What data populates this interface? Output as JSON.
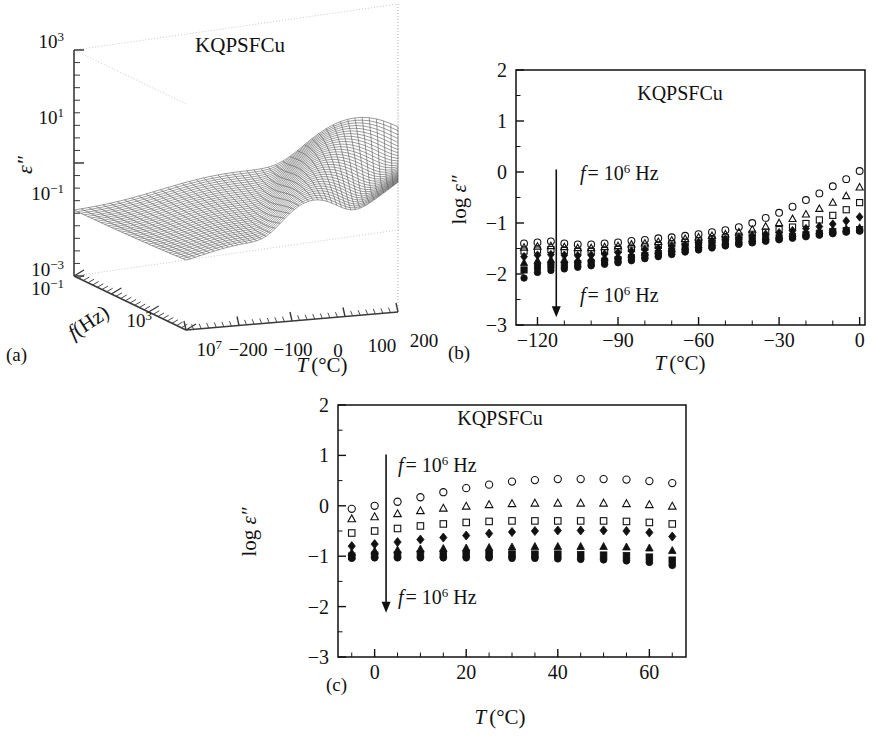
{
  "figure": {
    "background": "#ffffff",
    "ink": "#111111",
    "panels": [
      "a",
      "b",
      "c"
    ]
  },
  "panel_a": {
    "caption": "(a)",
    "sample_label": "KQPSFCu",
    "zlabel": "ε″",
    "flabel_italic": "f",
    "flabel_rest": "(Hz)",
    "tlabel_italic": "T",
    "tlabel_rest": "(°C)",
    "z_ticks": [
      "10",
      "10",
      "10"
    ],
    "z_tick_exponents": [
      "3",
      "1",
      "−1"
    ],
    "z_tick_low": "10",
    "z_tick_low_exp": "−3",
    "f_ticks": [
      "10",
      "10",
      "10"
    ],
    "f_tick_exponents": [
      "−1",
      "3",
      "7"
    ],
    "t_ticks": [
      "−200",
      "−100",
      "0",
      "100",
      "200"
    ]
  },
  "panel_b": {
    "caption": "(b)",
    "sample_label": "KQPSFCu",
    "ylabel_prefix": "log ",
    "ylabel_eps": "ε″",
    "xlabel_italic": "T",
    "xlabel_rest": "(°C)",
    "annotation_top": {
      "f": "f",
      "eq": "= 10",
      "exp": "6",
      "unit": " Hz"
    },
    "annotation_bottom": {
      "f": "f",
      "eq": "= 10",
      "exp": "6",
      "unit": " Hz"
    },
    "arrow_name": "decreasing-frequency-arrow",
    "y_ticks": [
      "2",
      "1",
      "0",
      "−1",
      "−2",
      "−3"
    ],
    "x_ticks": [
      "−120",
      "−90",
      "−60",
      "−30",
      "0"
    ]
  },
  "panel_c": {
    "caption": "(c)",
    "sample_label": "KQPSFCu",
    "ylabel_prefix": "log ",
    "ylabel_eps": "ε″",
    "xlabel_italic": "T",
    "xlabel_rest": "(°C)",
    "annotation_top": {
      "f": "f",
      "eq": "= 10",
      "exp": "6",
      "unit": " Hz"
    },
    "annotation_bottom": {
      "f": "f",
      "eq": "= 10",
      "exp": "6",
      "unit": " Hz"
    },
    "arrow_name": "decreasing-frequency-arrow",
    "y_ticks": [
      "2",
      "1",
      "0",
      "−1",
      "−2",
      "−3"
    ],
    "x_ticks": [
      "0",
      "20",
      "40",
      "60"
    ]
  },
  "chart_data": [
    {
      "id": "panel-a",
      "type": "surface",
      "title": "KQPSFCu",
      "xlabel": "T (°C)",
      "ylabel": "f (Hz)",
      "zlabel": "ε″",
      "xlim": [
        -200,
        200
      ],
      "ylim_log10": [
        -1,
        7
      ],
      "zlim_log10": [
        -3,
        3
      ],
      "x_tick_values": [
        -200,
        -100,
        0,
        100,
        200
      ],
      "y_tick_values_log10": [
        -1,
        3,
        7
      ],
      "z_tick_values_log10": [
        -3,
        -1,
        1,
        3
      ],
      "grid": false,
      "description": "Dense wireframe mesh of dielectric loss over temperature and frequency; a broad low plateau at low temperature/low frequency rising to a sharp alpha-relaxation ridge peaking near eps''~30 at high temperature, plus a secondary shoulder on the low-temperature side.",
      "mesh": {
        "nx": 41,
        "ny": 33,
        "peak_z_log10": 1.5,
        "plateau_z_log10": -1.7
      }
    },
    {
      "id": "panel-b",
      "type": "scatter",
      "title": "KQPSFCu",
      "xlabel": "T (°C)",
      "ylabel": "log ε″",
      "xlim": [
        -128,
        2
      ],
      "ylim": [
        -3,
        2
      ],
      "x_tick_values": [
        -120,
        -90,
        -60,
        -30,
        0
      ],
      "y_tick_values": [
        -3,
        -2,
        -1,
        0,
        1,
        2
      ],
      "grid": false,
      "annotations": [
        {
          "text": "f = 10^6 Hz",
          "x": -95,
          "y": -0.15
        },
        {
          "text": "f = 10^6 Hz",
          "x": -95,
          "y": -2.35
        },
        {
          "text": "arrow",
          "x": -113,
          "y0": 0.05,
          "y1": -2.85
        }
      ],
      "x": [
        -125,
        -120,
        -115,
        -110,
        -105,
        -100,
        -95,
        -90,
        -85,
        -80,
        -75,
        -70,
        -65,
        -60,
        -55,
        -50,
        -45,
        -40,
        -35,
        -30,
        -25,
        -20,
        -15,
        -10,
        -5,
        0
      ],
      "series": [
        {
          "name": "10^6 Hz",
          "marker": "open-circle",
          "values": [
            -1.4,
            -1.38,
            -1.36,
            -1.4,
            -1.42,
            -1.42,
            -1.4,
            -1.38,
            -1.35,
            -1.33,
            -1.3,
            -1.28,
            -1.25,
            -1.22,
            -1.18,
            -1.14,
            -1.08,
            -1.0,
            -0.9,
            -0.8,
            -0.68,
            -0.55,
            -0.42,
            -0.28,
            -0.14,
            0.02
          ]
        },
        {
          "name": "10^5 Hz",
          "marker": "open-triangle",
          "values": [
            -1.48,
            -1.46,
            -1.45,
            -1.47,
            -1.49,
            -1.49,
            -1.47,
            -1.45,
            -1.42,
            -1.4,
            -1.37,
            -1.34,
            -1.31,
            -1.28,
            -1.25,
            -1.22,
            -1.18,
            -1.13,
            -1.07,
            -1.0,
            -0.92,
            -0.83,
            -0.72,
            -0.6,
            -0.47,
            -0.3
          ]
        },
        {
          "name": "10^4 Hz",
          "marker": "open-square",
          "values": [
            -1.55,
            -1.53,
            -1.52,
            -1.54,
            -1.56,
            -1.56,
            -1.54,
            -1.52,
            -1.5,
            -1.47,
            -1.44,
            -1.41,
            -1.38,
            -1.35,
            -1.32,
            -1.29,
            -1.26,
            -1.22,
            -1.18,
            -1.13,
            -1.08,
            -1.01,
            -0.94,
            -0.85,
            -0.74,
            -0.6
          ]
        },
        {
          "name": "10^3 Hz",
          "marker": "filled-diamond",
          "values": [
            -1.66,
            -1.63,
            -1.62,
            -1.63,
            -1.64,
            -1.63,
            -1.61,
            -1.58,
            -1.55,
            -1.52,
            -1.49,
            -1.45,
            -1.42,
            -1.38,
            -1.35,
            -1.32,
            -1.29,
            -1.25,
            -1.22,
            -1.19,
            -1.15,
            -1.11,
            -1.07,
            -1.02,
            -0.96,
            -0.88
          ]
        },
        {
          "name": "10^2 Hz",
          "marker": "filled-triangle",
          "values": [
            -1.78,
            -1.74,
            -1.72,
            -1.72,
            -1.72,
            -1.7,
            -1.68,
            -1.65,
            -1.62,
            -1.58,
            -1.55,
            -1.51,
            -1.47,
            -1.43,
            -1.4,
            -1.37,
            -1.34,
            -1.31,
            -1.28,
            -1.25,
            -1.22,
            -1.19,
            -1.16,
            -1.13,
            -1.11,
            -1.09
          ]
        },
        {
          "name": "10^1 Hz",
          "marker": "filled-square",
          "values": [
            -1.92,
            -1.86,
            -1.83,
            -1.82,
            -1.8,
            -1.78,
            -1.75,
            -1.72,
            -1.68,
            -1.64,
            -1.6,
            -1.56,
            -1.52,
            -1.48,
            -1.44,
            -1.41,
            -1.38,
            -1.35,
            -1.32,
            -1.29,
            -1.26,
            -1.23,
            -1.2,
            -1.17,
            -1.15,
            -1.13
          ]
        },
        {
          "name": "10^0 Hz",
          "marker": "filled-circle",
          "values": [
            -2.08,
            -1.97,
            -1.93,
            -1.9,
            -1.87,
            -1.84,
            -1.81,
            -1.78,
            -1.74,
            -1.7,
            -1.66,
            -1.62,
            -1.57,
            -1.53,
            -1.49,
            -1.45,
            -1.42,
            -1.39,
            -1.36,
            -1.33,
            -1.3,
            -1.27,
            -1.24,
            -1.21,
            -1.18,
            -1.16
          ]
        }
      ]
    },
    {
      "id": "panel-c",
      "type": "scatter",
      "title": "KQPSFCu",
      "xlabel": "T (°C)",
      "ylabel": "log ε″",
      "xlim": [
        -8,
        68
      ],
      "ylim": [
        -3,
        2
      ],
      "x_tick_values": [
        0,
        20,
        40,
        60
      ],
      "y_tick_values": [
        -3,
        -2,
        -1,
        0,
        1,
        2
      ],
      "grid": false,
      "annotations": [
        {
          "text": "f = 10^6 Hz",
          "x": 9,
          "y": 0.82
        },
        {
          "text": "f = 10^6 Hz",
          "x": 9,
          "y": -1.78
        },
        {
          "text": "arrow",
          "x": 2.5,
          "y0": 1.02,
          "y1": -2.12
        }
      ],
      "x": [
        -5,
        0,
        5,
        10,
        15,
        20,
        25,
        30,
        35,
        40,
        45,
        50,
        55,
        60,
        65
      ],
      "series": [
        {
          "name": "10^6 Hz",
          "marker": "open-circle",
          "values": [
            -0.06,
            0.0,
            0.08,
            0.17,
            0.27,
            0.35,
            0.42,
            0.48,
            0.51,
            0.53,
            0.53,
            0.53,
            0.52,
            0.49,
            0.45
          ]
        },
        {
          "name": "10^5 Hz",
          "marker": "open-triangle",
          "values": [
            -0.26,
            -0.22,
            -0.16,
            -0.1,
            -0.05,
            -0.01,
            0.02,
            0.04,
            0.05,
            0.05,
            0.05,
            0.05,
            0.04,
            0.02,
            -0.01
          ]
        },
        {
          "name": "10^4 Hz",
          "marker": "open-square",
          "values": [
            -0.54,
            -0.5,
            -0.45,
            -0.4,
            -0.36,
            -0.33,
            -0.31,
            -0.3,
            -0.3,
            -0.3,
            -0.3,
            -0.3,
            -0.31,
            -0.33,
            -0.36
          ]
        },
        {
          "name": "10^3 Hz",
          "marker": "filled-diamond",
          "values": [
            -0.8,
            -0.76,
            -0.72,
            -0.67,
            -0.63,
            -0.59,
            -0.55,
            -0.52,
            -0.5,
            -0.49,
            -0.49,
            -0.49,
            -0.5,
            -0.53,
            -0.61
          ]
        },
        {
          "name": "10^2 Hz",
          "marker": "filled-triangle",
          "values": [
            -0.93,
            -0.9,
            -0.88,
            -0.86,
            -0.85,
            -0.84,
            -0.83,
            -0.82,
            -0.81,
            -0.81,
            -0.81,
            -0.81,
            -0.82,
            -0.84,
            -0.89
          ]
        },
        {
          "name": "10^1 Hz",
          "marker": "filled-square",
          "values": [
            -1.0,
            -0.98,
            -0.97,
            -0.96,
            -0.96,
            -0.96,
            -0.96,
            -0.96,
            -0.96,
            -0.96,
            -0.97,
            -0.98,
            -0.99,
            -1.02,
            -1.08
          ]
        },
        {
          "name": "10^0 Hz",
          "marker": "filled-circle",
          "values": [
            -1.04,
            -1.03,
            -1.03,
            -1.03,
            -1.03,
            -1.03,
            -1.03,
            -1.04,
            -1.04,
            -1.05,
            -1.06,
            -1.07,
            -1.09,
            -1.12,
            -1.18
          ]
        }
      ]
    }
  ]
}
